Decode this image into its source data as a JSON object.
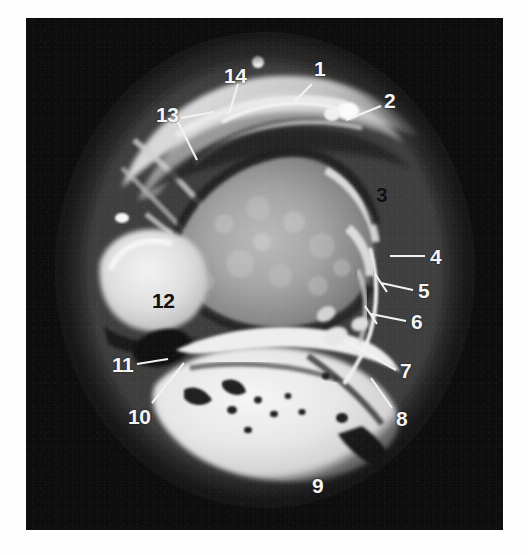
{
  "figure": {
    "kind": "anatomical-cross-section-scan",
    "modality_appearance": "grayscale tomographic slice",
    "plate_background_color": "#090909",
    "label_light_color": "#f4f4f4",
    "label_dark_color": "#0a0a0a",
    "leader_line_color": "#f2f2f2"
  },
  "labels": [
    {
      "id": "label-1",
      "text": "1",
      "x": 288,
      "y": 40,
      "style": "light",
      "leader": "M 286,66 L 268,84"
    },
    {
      "id": "label-2",
      "text": "2",
      "x": 358,
      "y": 72,
      "style": "light",
      "leader": "M 355,88 L 320,102"
    },
    {
      "id": "label-3",
      "text": "3",
      "x": 350,
      "y": 166,
      "style": "dark",
      "leader": ""
    },
    {
      "id": "label-4",
      "text": "4",
      "x": 404,
      "y": 228,
      "style": "light",
      "leader": "M 399,238 L 364,238"
    },
    {
      "id": "label-5",
      "text": "5",
      "x": 392,
      "y": 262,
      "style": "light",
      "leader": "M 387,272 L 355,265 M 349,256 L 361,274"
    },
    {
      "id": "label-6",
      "text": "6",
      "x": 385,
      "y": 293,
      "style": "light",
      "leader": "M 380,303 L 345,296 M 339,288 L 351,306"
    },
    {
      "id": "label-7",
      "text": "7",
      "x": 374,
      "y": 342,
      "style": "light",
      "leader": "M 370,352 L 318,322"
    },
    {
      "id": "label-8",
      "text": "8",
      "x": 370,
      "y": 390,
      "style": "light",
      "leader": "M 366,390 L 345,360"
    },
    {
      "id": "label-9",
      "text": "9",
      "x": 286,
      "y": 457,
      "style": "light",
      "leader": ""
    },
    {
      "id": "label-10",
      "text": "10",
      "x": 102,
      "y": 388,
      "style": "light",
      "leader": "M 126,385 L 158,345"
    },
    {
      "id": "label-11",
      "text": "11",
      "x": 86,
      "y": 336,
      "style": "light",
      "leader": "M 111,346 L 142,341"
    },
    {
      "id": "label-12",
      "text": "12",
      "x": 126,
      "y": 272,
      "style": "dark",
      "leader": ""
    },
    {
      "id": "label-13",
      "text": "13",
      "x": 130,
      "y": 86,
      "style": "light",
      "leader": "M 155,100 L 188,94 M 152,104 L 171,142"
    },
    {
      "id": "label-14",
      "text": "14",
      "x": 198,
      "y": 47,
      "style": "light",
      "leader": "M 212,66 L 203,96"
    }
  ],
  "anatomy_regions": [
    {
      "name": "superior-soft-tissue-band",
      "note": "bright curved band across the top of the field"
    },
    {
      "name": "central-bone-body",
      "note": "large mid-grey trabecular body in the centre"
    },
    {
      "name": "medial-bright-ossicle",
      "note": "bright rounded structure at label 12"
    },
    {
      "name": "inferior-cancellous-bone",
      "note": "large bright wedge of cancellous bone at label 9"
    },
    {
      "name": "lateral-cortical-margin",
      "note": "thin bright cortical line near labels 4-8"
    },
    {
      "name": "joint-space-dark-cleft",
      "note": "dark cleft separating the central body from the inferior bone"
    }
  ]
}
